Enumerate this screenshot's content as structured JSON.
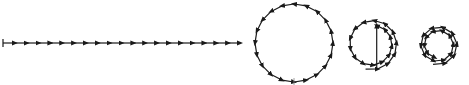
{
  "diagram": {
    "stroke_color": "#1a1a1a",
    "background_color": "#ffffff",
    "stages": [
      {
        "name": "straight-line",
        "x1": 3,
        "x2": 240,
        "y": 43,
        "arrow_count": 20
      },
      {
        "name": "single-circle",
        "cx": 294,
        "cy": 43,
        "r": 39,
        "arrow_count": 20
      },
      {
        "name": "spiral-one-and-half-turns",
        "cx": 372,
        "cy": 44,
        "outer_r": 26,
        "inner_r": 19,
        "arrow_count": 20
      },
      {
        "name": "spiral-two-turns",
        "cx": 438,
        "cy": 45,
        "outer_r": 20,
        "inner_r": 13,
        "arrow_count": 20
      }
    ]
  }
}
